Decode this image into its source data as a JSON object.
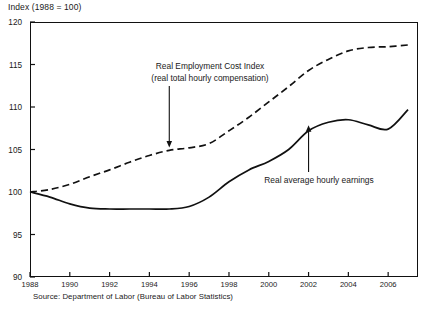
{
  "figure": {
    "axis_title": "Index (1988 = 100)",
    "source_note": "Source: Department of Labor (Bureau of Labor Statistics)"
  },
  "annotations": {
    "eci_line1": "Real Employment Cost Index",
    "eci_line2": "(real total hourly compensation)",
    "ahe_label": "Real average hourly earnings"
  },
  "chart_data": {
    "type": "line",
    "title": "",
    "subtitle": "",
    "xlabel": "",
    "ylabel": "Index (1988 = 100)",
    "xlim": [
      1988,
      2007.5
    ],
    "ylim": [
      90,
      120
    ],
    "yticks": [
      90,
      95,
      100,
      105,
      110,
      115,
      120
    ],
    "xticks": [
      1988,
      1990,
      1992,
      1994,
      1996,
      1998,
      2000,
      2002,
      2004,
      2006
    ],
    "grid": false,
    "legend": "annotations-with-arrows",
    "x": [
      1988,
      1989,
      1990,
      1991,
      1992,
      1993,
      1994,
      1995,
      1996,
      1997,
      1998,
      1999,
      2000,
      2001,
      2002,
      2003,
      2004,
      2005,
      2006,
      2007
    ],
    "series": [
      {
        "name": "Real Employment Cost Index (real total hourly compensation)",
        "style": "dashed",
        "color": "#111111",
        "values": [
          100.0,
          100.3,
          100.9,
          101.8,
          102.6,
          103.5,
          104.3,
          104.9,
          105.2,
          105.7,
          107.2,
          108.8,
          110.6,
          112.4,
          114.3,
          115.6,
          116.6,
          117.0,
          117.1,
          117.3
        ]
      },
      {
        "name": "Real average hourly earnings",
        "style": "solid",
        "color": "#111111",
        "values": [
          100.0,
          99.4,
          98.6,
          98.1,
          98.0,
          98.0,
          98.0,
          98.0,
          98.3,
          99.4,
          101.2,
          102.6,
          103.6,
          105.0,
          107.2,
          108.2,
          108.5,
          107.9,
          107.4,
          109.7
        ]
      }
    ],
    "annotations": [
      {
        "text": "Real Employment Cost Index (real total hourly compensation)",
        "target_x": 1995,
        "target_y": 105.0,
        "arrow": "down"
      },
      {
        "text": "Real average hourly earnings",
        "target_x": 2002,
        "target_y": 108.2,
        "arrow": "up"
      }
    ]
  },
  "ytick_labels": [
    "120",
    "115",
    "110",
    "105",
    "100",
    "95",
    "90"
  ],
  "xtick_labels": [
    "1988",
    "1990",
    "1992",
    "1994",
    "1996",
    "1998",
    "2000",
    "2002",
    "2004",
    "2006"
  ]
}
